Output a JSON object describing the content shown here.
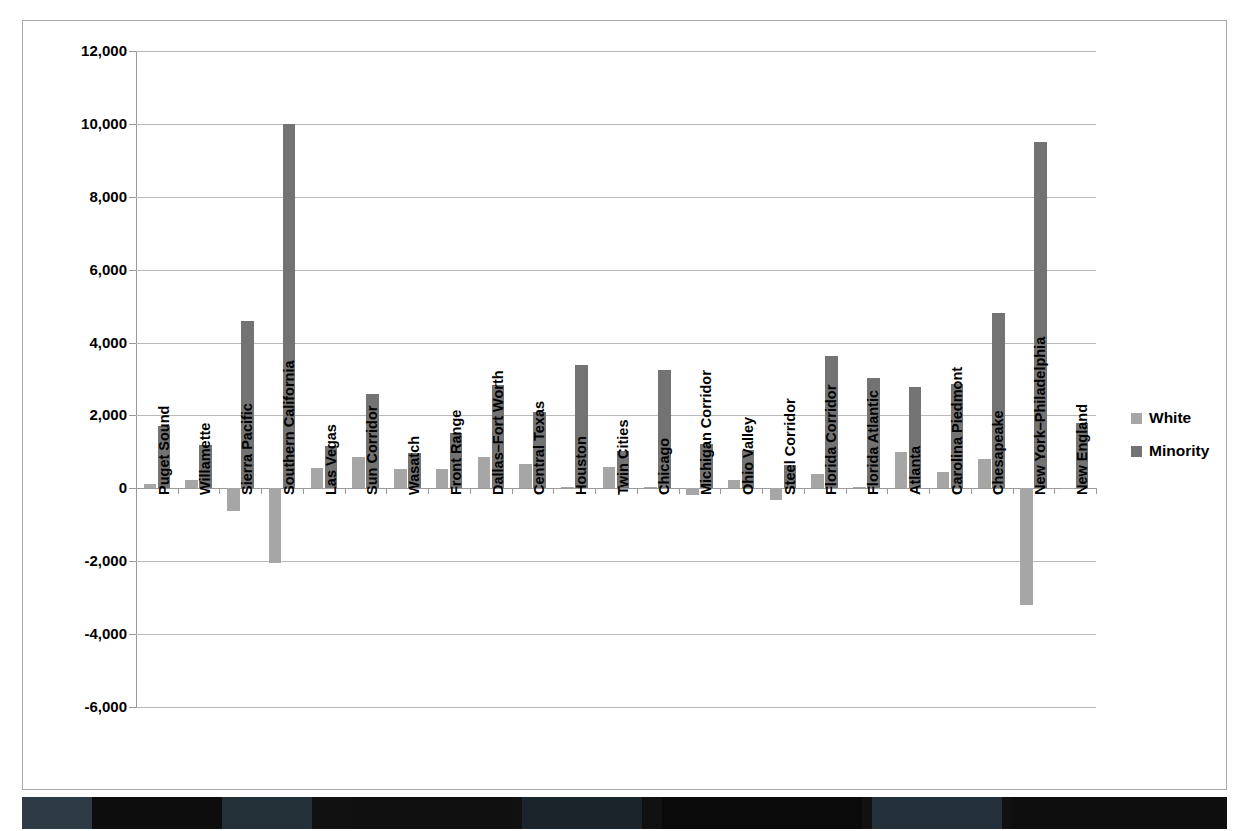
{
  "chart_data": {
    "type": "bar",
    "title": "",
    "subtitle": "",
    "xlabel": "",
    "ylabel": "",
    "ylim": [
      -6000,
      12000
    ],
    "ytick_step": 2000,
    "grid": true,
    "legend_position": "right",
    "yticks": [
      "12,000",
      "10,000",
      "8,000",
      "6,000",
      "4,000",
      "2,000",
      "0",
      "-2,000",
      "-4,000",
      "-6,000"
    ],
    "ytick_values": [
      12000,
      10000,
      8000,
      6000,
      4000,
      2000,
      0,
      -2000,
      -4000,
      -6000
    ],
    "categories": [
      "Puget Sound",
      "Willamette",
      "Sierra Pacific",
      "Southern California",
      "Las Vegas",
      "Sun Corridor",
      "Wasatch",
      "Front Range",
      "Dallas–Fort Worth",
      "Central Texas",
      "Houston",
      "Twin Cities",
      "Chicago",
      "Michigan Corridor",
      "Ohio Valley",
      "Steel Corridor",
      "Florida Corridor",
      "Florida Atlantic",
      "Atlanta",
      "Carolina Piedmont",
      "Chesapeake",
      "New York–Philadelphia",
      "New England"
    ],
    "series": [
      {
        "name": "White",
        "color": "#a6a6a6",
        "values": [
          110,
          220,
          -620,
          -2050,
          550,
          850,
          520,
          520,
          850,
          680,
          50,
          580,
          30,
          -180,
          220,
          -320,
          380,
          50,
          1000,
          450,
          800,
          -3200,
          20
        ]
      },
      {
        "name": "Minority",
        "color": "#737373",
        "values": [
          1700,
          1200,
          4600,
          10000,
          1150,
          2580,
          960,
          1530,
          2840,
          2100,
          3380,
          1030,
          3250,
          1230,
          1060,
          630,
          3620,
          3040,
          2770,
          2870,
          4810,
          9500,
          1800
        ]
      }
    ]
  },
  "legend": {
    "items": [
      {
        "label": "White",
        "swatch": "white"
      },
      {
        "label": "Minority",
        "swatch": "minority"
      }
    ]
  },
  "colors": {
    "white_series": "#a6a6a6",
    "minority_series": "#737373",
    "gridline": "#b9b9b9",
    "axis": "#9a9a9a",
    "frame": "#a9a9a9",
    "text": "#000000"
  }
}
